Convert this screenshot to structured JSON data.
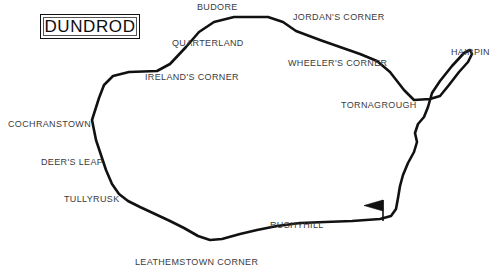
{
  "map": {
    "title": "DUNDROD",
    "background_color": "#ffffff",
    "track_color": "#111111",
    "label_color": "#3b3b3d",
    "track_name": "dundrod-circuit-outline",
    "start_finish_marker": "flag-icon",
    "top_strip_artifact": "",
    "labels": [
      {
        "name": "budore",
        "text": "BUDORE",
        "x": 197,
        "y": 2
      },
      {
        "name": "jordans-corner",
        "text": "JORDAN'S CORNER",
        "x": 293,
        "y": 12
      },
      {
        "name": "quarterland",
        "text": "QUARTERLAND",
        "x": 172,
        "y": 38
      },
      {
        "name": "wheelers-corner",
        "text": "WHEELER'S CORNER",
        "x": 288,
        "y": 58
      },
      {
        "name": "hairpin",
        "text": "HAIRPIN",
        "x": 451,
        "y": 47
      },
      {
        "name": "irelands-corner",
        "text": "IRELAND'S CORNER",
        "x": 145,
        "y": 72
      },
      {
        "name": "tornagrough",
        "text": "TORNAGROUGH",
        "x": 341,
        "y": 100
      },
      {
        "name": "cochranstown",
        "text": "COCHRANSTOWN",
        "x": 8,
        "y": 119
      },
      {
        "name": "deers-leap",
        "text": "DEER'S LEAP",
        "x": 41,
        "y": 157
      },
      {
        "name": "tullyrusk",
        "text": "TULLYRUSK",
        "x": 64,
        "y": 194
      },
      {
        "name": "rushyhill",
        "text": "RUSHYHILL",
        "x": 270,
        "y": 220
      },
      {
        "name": "leathemstown-corner",
        "text": "LEATHEMSTOWN CORNER",
        "x": 135,
        "y": 257
      }
    ],
    "geometry": {
      "track_path": "M 92,120 L 99,98 L 104,85 L 113,76 L 129,72 L 157,71 L 170,64 L 186,47 L 199,32 L 214,22 L 234,17 L 268,17 L 283,22 L 296,31 L 320,40 L 340,47 L 360,54 L 377,61 L 390,72 L 404,90 L 414,100 L 430,99 L 440,96 L 449,85 L 459,72 L 468,62 L 472,54 L 470,50 L 464,53 L 452,66 L 440,81 L 432,93 L 428,107 L 424,117 L 418,124 L 415,133 L 417,142 L 414,152 L 408,163 L 403,175 L 400,186 L 398,198 L 396,209 L 391,216 L 380,219 L 352,221 L 325,222 L 300,223 L 277,226 L 257,230 L 240,234 L 222,239 L 210,240 L 198,236 L 184,228 L 170,221 L 155,214 L 140,207 L 128,201 L 119,194 L 112,184 L 106,170 L 101,155 L 96,140 Z",
      "flag_pole": {
        "x": 383,
        "y1": 201,
        "y2": 221
      },
      "flag_banner": "M 383,201 L 365,206 L 383,211 Z"
    }
  }
}
